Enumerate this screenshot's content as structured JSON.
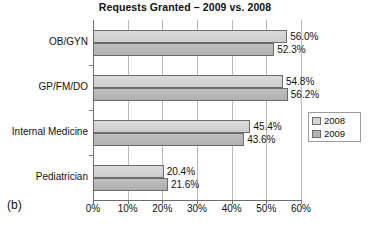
{
  "figure": {
    "caption": "(b)"
  },
  "chart_data": {
    "type": "bar",
    "orientation": "horizontal",
    "title": "Requests Granted – 2009 vs. 2008",
    "xlabel": "",
    "ylabel": "",
    "categories": [
      "OB/GYN",
      "GP/FM/DO",
      "Internal Medicine",
      "Pediatrician"
    ],
    "series": [
      {
        "name": "2008",
        "color": "#d2d2d2",
        "values": [
          56.0,
          54.8,
          45.4,
          20.4
        ],
        "labels": [
          "56.0%",
          "54.8%",
          "45.4%",
          "20.4%"
        ]
      },
      {
        "name": "2009",
        "color": "#b6b6b6",
        "values": [
          52.3,
          56.2,
          43.6,
          21.6
        ],
        "labels": [
          "52.3%",
          "56.2%",
          "43.6%",
          "21.6%"
        ]
      }
    ],
    "xlim": [
      0,
      60
    ],
    "xticks": [
      0,
      10,
      20,
      30,
      40,
      50,
      60
    ],
    "xtick_labels": [
      "0%",
      "10%",
      "20%",
      "30%",
      "40%",
      "50%",
      "60%"
    ],
    "grid": true,
    "legend_position": "right"
  }
}
